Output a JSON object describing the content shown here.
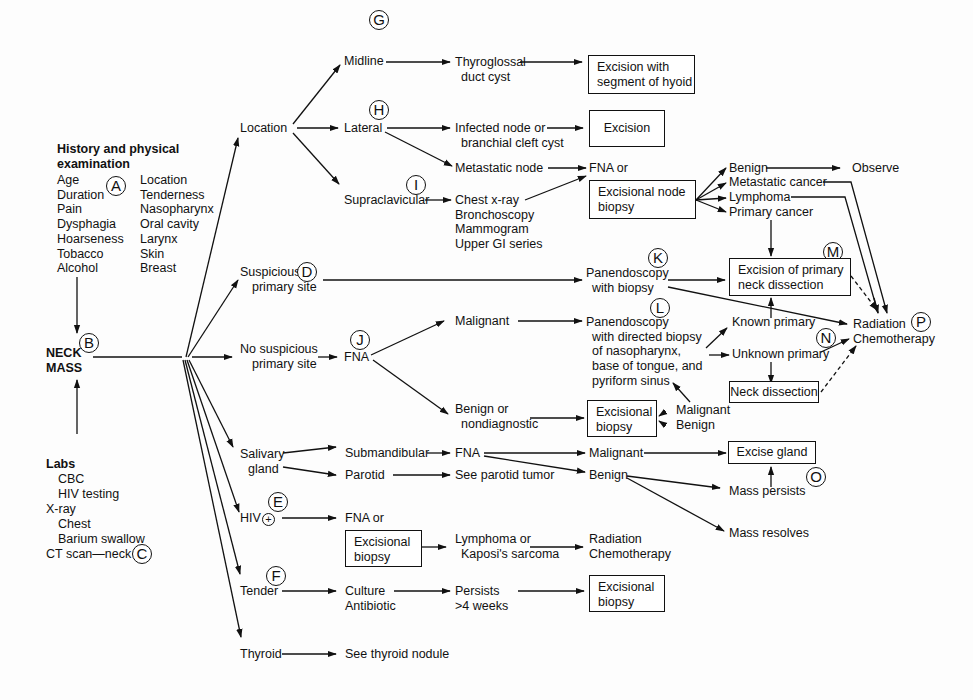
{
  "diagram": {
    "markers": {
      "A": "A",
      "B": "B",
      "C": "C",
      "D": "D",
      "E": "E",
      "F": "F",
      "G": "G",
      "H": "H",
      "I": "I",
      "J": "J",
      "K": "K",
      "L": "L",
      "M": "M",
      "N": "N",
      "O": "O",
      "P": "P"
    },
    "history": {
      "title_line1": "History and physical",
      "title_line2": "examination",
      "col1": [
        "Age",
        "Duration",
        "Pain",
        "Dysphagia",
        "Hoarseness",
        "Tobacco",
        "Alcohol"
      ],
      "col2": [
        "Location",
        "Tenderness",
        "Nasopharynx",
        "Oral cavity",
        "Larynx",
        "Skin",
        "Breast"
      ]
    },
    "neck_mass": {
      "line1": "NECK",
      "line2": "MASS"
    },
    "labs": {
      "title": "Labs",
      "items": [
        "CBC",
        "HIV testing"
      ],
      "xray": "X-ray",
      "xray_items": [
        "Chest",
        "Barium swallow"
      ],
      "ct": "CT scan—neck"
    },
    "branches": {
      "location": "Location",
      "suspicious_l1": "Suspicious",
      "suspicious_l2": "primary site",
      "no_suspicious_l1": "No suspicious",
      "no_suspicious_l2": "primary site",
      "salivary_l1": "Salivary",
      "salivary_l2": "gland",
      "hiv": "HIV",
      "hiv_sign": "+",
      "tender": "Tender",
      "thyroid": "Thyroid"
    },
    "location": {
      "midline": "Midline",
      "lateral": "Lateral",
      "supraclavicular": "Supraclavicular",
      "thyroglossal_l1": "Thyroglossal",
      "thyroglossal_l2": "duct cyst",
      "excision_hyoid_l1": "Excision with",
      "excision_hyoid_l2": "segment of hyoid",
      "infected_l1": "Infected node or",
      "infected_l2": "branchial cleft cyst",
      "excision": "Excision",
      "metastatic_node": "Metastatic node",
      "supra_tests": [
        "Chest x-ray",
        "Bronchoscopy",
        "Mammogram",
        "Upper GI series"
      ],
      "fna_or": "FNA or",
      "excisional_node_l1": "Excisional node",
      "excisional_node_l2": "biopsy",
      "outcomes": [
        "Benign",
        "Metastatic cancer",
        "Lymphoma",
        "Primary cancer"
      ],
      "observe": "Observe"
    },
    "suspicious": {
      "pan_l1": "Panendoscopy",
      "pan_l2": "with biopsy",
      "excision_primary_l1": "Excision of primary",
      "excision_primary_l2": "neck dissection"
    },
    "no_suspicious": {
      "fna": "FNA",
      "malignant": "Malignant",
      "benign_l1": "Benign or",
      "benign_l2": "nondiagnostic",
      "pan_directed": [
        "Panendoscopy",
        "with directed biopsy",
        "of nasopharynx,",
        "base of tongue, and",
        "pyriform sinus"
      ],
      "excisional_l1": "Excisional",
      "excisional_l2": "biopsy",
      "eb_malignant": "Malignant",
      "eb_benign": "Benign",
      "known_primary": "Known primary",
      "unknown_primary": "Unknown primary",
      "neck_dissection": "Neck dissection",
      "radiation": "Radiation",
      "chemotherapy": "Chemotherapy"
    },
    "salivary": {
      "submandibular": "Submandibular",
      "parotid": "Parotid",
      "fna": "FNA",
      "see_parotid": "See parotid tumor",
      "malignant": "Malignant",
      "benign": "Benign",
      "excise_gland": "Excise gland",
      "mass_persists": "Mass persists",
      "mass_resolves": "Mass resolves"
    },
    "hiv": {
      "fna_or": "FNA or",
      "excisional_l1": "Excisional",
      "excisional_l2": "biopsy",
      "lymphoma_l1": "Lymphoma or",
      "lymphoma_l2": "Kaposi's sarcoma",
      "radiation": "Radiation",
      "chemotherapy": "Chemotherapy"
    },
    "tender": {
      "culture": "Culture",
      "antibiotic": "Antibiotic",
      "persists_l1": "Persists",
      "persists_l2": ">4 weeks",
      "excisional_l1": "Excisional",
      "excisional_l2": "biopsy"
    },
    "thyroid": {
      "see_nodule": "See thyroid nodule"
    }
  }
}
